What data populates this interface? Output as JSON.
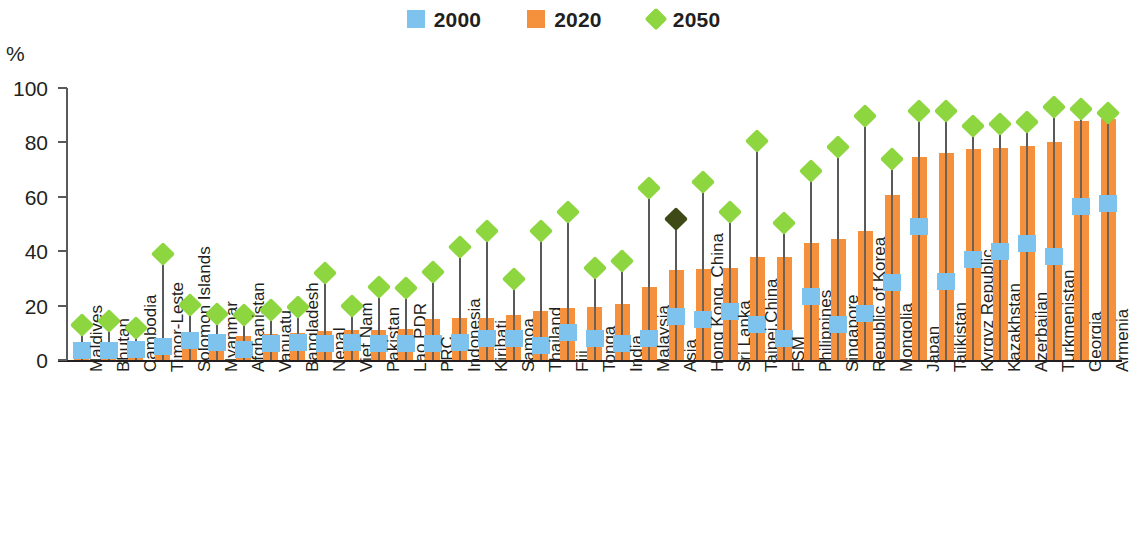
{
  "chart_data": {
    "type": "bar",
    "title": "",
    "subtitle": "",
    "xlabel": "",
    "ylabel": "%",
    "ylim": [
      0,
      100
    ],
    "yticks": [
      0,
      20,
      40,
      60,
      80,
      100
    ],
    "grid": false,
    "legend_position": "top-center",
    "legend": [
      "2000",
      "2020",
      "2050"
    ],
    "colors": {
      "2000": "#7ec3ee",
      "2020": "#f5903c",
      "2050": "#8dd63f",
      "highlight_2050": "#3d4a18",
      "stem": "#58595b",
      "axis": "#231f20"
    },
    "highlight_category": "Asia",
    "categories": [
      "Maldives",
      "Bhutan",
      "Cambodia",
      "Timor-Leste",
      "Solomon Islands",
      "Myanmar",
      "Afghanistan",
      "Vanuatu",
      "Bangladesh",
      "Nepal",
      "Viet Nam",
      "Pakistan",
      "Lao PDR",
      "PRC",
      "Indonesia",
      "Kiribati",
      "Samoa",
      "Thailand",
      "Fiji",
      "Tonga",
      "India",
      "Malaysia",
      "Asia",
      "Hong Kong, China",
      "Sri Lanka",
      "Taipei,China",
      "FSM",
      "Philippines",
      "Singapore",
      "Republic of Korea",
      "Mongolia",
      "Japan",
      "Tajikistan",
      "Kyrgyz Republic",
      "Kazakhstan",
      "Azerbaijan",
      "Turkmenistan",
      "Georgia",
      "Armenia"
    ],
    "series": [
      {
        "name": "2000",
        "values": [
          3.5,
          3.5,
          4,
          5,
          7,
          6.5,
          4,
          6,
          6.5,
          6,
          6.5,
          6,
          6,
          6,
          6.5,
          8,
          8,
          5.5,
          10,
          8,
          6,
          8,
          16,
          15,
          18,
          13,
          8,
          23.5,
          13,
          17,
          28.5,
          49,
          29,
          37,
          40,
          43,
          38,
          56.5,
          57.5
        ]
      },
      {
        "name": "2020",
        "values": [
          4,
          4,
          4.5,
          5.5,
          8.5,
          8.5,
          9,
          9.5,
          10,
          10.5,
          11,
          11,
          11.5,
          15,
          15.5,
          15.5,
          16.5,
          18,
          19,
          19.5,
          20.5,
          27,
          33,
          33.5,
          34,
          38,
          38,
          43,
          44.5,
          47.5,
          60.5,
          74.5,
          76,
          77.5,
          78,
          78.5,
          80,
          88,
          88.5
        ]
      },
      {
        "name": "2050",
        "values": [
          16,
          17.5,
          15,
          42,
          23.5,
          20,
          19.5,
          21.5,
          22.5,
          35,
          23,
          30,
          29.5,
          35.5,
          44.5,
          50.5,
          33,
          50.5,
          57.5,
          37,
          39.5,
          66.5,
          55,
          68.5,
          57.5,
          83.5,
          53.5,
          72.5,
          81.5,
          93,
          77,
          94.5,
          94.5,
          89,
          90,
          90.5,
          96,
          95.5,
          94
        ]
      }
    ]
  },
  "legend_items": [
    {
      "label": "2000",
      "shape": "square",
      "color": "#7ec3ee"
    },
    {
      "label": "2020",
      "shape": "square",
      "color": "#f5903c"
    },
    {
      "label": "2050",
      "shape": "diamond",
      "color": "#8dd63f"
    }
  ],
  "axis": {
    "unit_label": "%",
    "tick_labels": [
      "100",
      "80",
      "60",
      "40",
      "20",
      "0"
    ]
  }
}
